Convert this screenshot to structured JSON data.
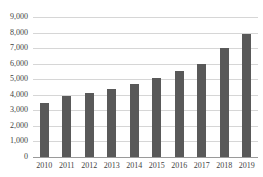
{
  "chart_data": {
    "type": "bar",
    "title": "ESTIMATED 2010-2019",
    "subtitle": "",
    "xlabel": "",
    "ylabel": "",
    "categories": [
      "2010",
      "2011",
      "2012",
      "2013",
      "2014",
      "2015",
      "2016",
      "2017",
      "2018",
      "2019"
    ],
    "values": [
      3500,
      3900,
      4100,
      4350,
      4700,
      5100,
      5500,
      6000,
      7000,
      7900
    ],
    "ylim": [
      0,
      9000
    ],
    "ytick_step": 1000,
    "ytick_labels": [
      "0",
      "1,000",
      "2,000",
      "3,000",
      "4,000",
      "5,000",
      "6,000",
      "7,000",
      "8,000",
      "9,000"
    ],
    "ytick_values": [
      0,
      1000,
      2000,
      3000,
      4000,
      5000,
      6000,
      7000,
      8000,
      9000
    ],
    "grid": true,
    "grid_axis": "y",
    "legend": false,
    "legend_position": "none",
    "bar_color": "#595959",
    "gridline_color": "#d6d6d6",
    "axis_color": "#9a9a9a",
    "text_color": "#3f3f3f",
    "background_color": "#ffffff",
    "data_labels": false,
    "title_cropped": true
  }
}
